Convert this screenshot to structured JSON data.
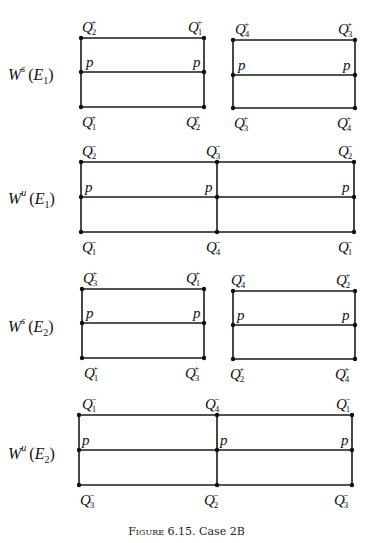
{
  "caption": {
    "prefix": "Figure",
    "number": "6.15.",
    "text": "Case 2B"
  },
  "rows": [
    {
      "label": {
        "W": "W",
        "sup": "s",
        "E": "E",
        "sub": "1"
      },
      "label_y": 75,
      "rects": [
        {
          "x1": 81,
          "x2": 204,
          "top": 38,
          "mid": 72,
          "bot": 107,
          "divider": null,
          "top_labels": [
            {
              "x": 82,
              "sign": "+",
              "idx": "2"
            },
            {
              "x": 188,
              "sign": "+",
              "idx": "1"
            }
          ],
          "bot_labels": [
            {
              "x": 82,
              "sign": "+",
              "idx": "1"
            },
            {
              "x": 186,
              "sign": "+",
              "idx": "2"
            }
          ],
          "p_labels": [
            {
              "x": 86
            },
            {
              "x": 193
            }
          ]
        },
        {
          "x1": 233,
          "x2": 355,
          "top": 40,
          "mid": 75,
          "bot": 108,
          "divider": null,
          "top_labels": [
            {
              "x": 235,
              "sign": "+",
              "idx": "4"
            },
            {
              "x": 338,
              "sign": "+",
              "idx": "3"
            }
          ],
          "bot_labels": [
            {
              "x": 234,
              "sign": "+",
              "idx": "3"
            },
            {
              "x": 337,
              "sign": "+",
              "idx": "4"
            }
          ],
          "p_labels": [
            {
              "x": 238
            },
            {
              "x": 343
            }
          ]
        }
      ]
    },
    {
      "label": {
        "W": "W",
        "sup": "u",
        "E": "E",
        "sub": "1"
      },
      "label_y": 199,
      "rects": [
        {
          "x1": 81,
          "x2": 354,
          "top": 162,
          "mid": 197,
          "bot": 232,
          "divider": 217,
          "top_labels": [
            {
              "x": 82,
              "sign": "−",
              "idx": "2"
            },
            {
              "x": 206,
              "sign": "−",
              "idx": "3"
            },
            {
              "x": 338,
              "sign": "−",
              "idx": "2"
            }
          ],
          "bot_labels": [
            {
              "x": 82,
              "sign": "−",
              "idx": "1"
            },
            {
              "x": 206,
              "sign": "−",
              "idx": "4"
            },
            {
              "x": 338,
              "sign": "−",
              "idx": "1"
            }
          ],
          "p_labels": [
            {
              "x": 85
            },
            {
              "x": 205
            },
            {
              "x": 342
            }
          ]
        }
      ]
    },
    {
      "label": {
        "W": "W",
        "sup": "s",
        "E": "E",
        "sub": "2"
      },
      "label_y": 327,
      "rects": [
        {
          "x1": 82,
          "x2": 204,
          "top": 289,
          "mid": 323,
          "bot": 358,
          "divider": null,
          "top_labels": [
            {
              "x": 83,
              "sign": "+",
              "idx": "3"
            },
            {
              "x": 186,
              "sign": "+",
              "idx": "1"
            }
          ],
          "bot_labels": [
            {
              "x": 84,
              "sign": "+",
              "idx": "1"
            },
            {
              "x": 185,
              "sign": "+",
              "idx": "3"
            }
          ],
          "p_labels": [
            {
              "x": 86
            },
            {
              "x": 193
            }
          ]
        },
        {
          "x1": 233,
          "x2": 355,
          "top": 291,
          "mid": 325,
          "bot": 359,
          "divider": null,
          "top_labels": [
            {
              "x": 231,
              "sign": "+",
              "idx": "4"
            },
            {
              "x": 336,
              "sign": "+",
              "idx": "2"
            }
          ],
          "bot_labels": [
            {
              "x": 230,
              "sign": "+",
              "idx": "2"
            },
            {
              "x": 335,
              "sign": "+",
              "idx": "4"
            }
          ],
          "p_labels": [
            {
              "x": 237
            },
            {
              "x": 342
            }
          ]
        }
      ]
    },
    {
      "label": {
        "W": "W",
        "sup": "u",
        "E": "E",
        "sub": "2"
      },
      "label_y": 454,
      "rects": [
        {
          "x1": 79,
          "x2": 352,
          "top": 415,
          "mid": 450,
          "bot": 485,
          "divider": 217,
          "top_labels": [
            {
              "x": 82,
              "sign": "−",
              "idx": "1"
            },
            {
              "x": 205,
              "sign": "−",
              "idx": "4"
            },
            {
              "x": 336,
              "sign": "−",
              "idx": "1"
            }
          ],
          "bot_labels": [
            {
              "x": 80,
              "sign": "−",
              "idx": "3"
            },
            {
              "x": 204,
              "sign": "−",
              "idx": "2"
            },
            {
              "x": 334,
              "sign": "−",
              "idx": "3"
            }
          ],
          "p_labels": [
            {
              "x": 82
            },
            {
              "x": 220
            },
            {
              "x": 341
            }
          ]
        }
      ]
    }
  ]
}
